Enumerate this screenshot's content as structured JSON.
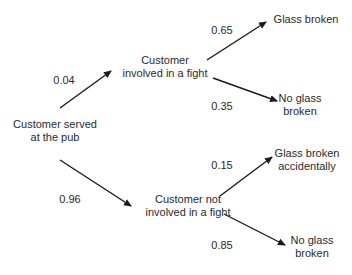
{
  "diagram": {
    "type": "probability-tree",
    "nodes": {
      "root": {
        "lines": [
          "Customer served",
          "at the pub"
        ]
      },
      "fight": {
        "lines": [
          "Customer",
          "involved in a fight"
        ]
      },
      "no_fight": {
        "lines": [
          "Customer not",
          "involved in a fight"
        ]
      },
      "fight_glass_broken": {
        "lines": [
          "Glass broken"
        ]
      },
      "fight_no_glass": {
        "lines": [
          "No glass",
          "broken"
        ]
      },
      "nofight_glass_broken": {
        "lines": [
          "Glass broken",
          "accidentally"
        ]
      },
      "nofight_no_glass": {
        "lines": [
          "No glass",
          "broken"
        ]
      }
    },
    "edges": {
      "root_to_fight": {
        "prob": "0.04"
      },
      "root_to_no_fight": {
        "prob": "0.96"
      },
      "fight_to_glass_broken": {
        "prob": "0.65"
      },
      "fight_to_no_glass": {
        "prob": "0.35"
      },
      "nofight_to_glass_broken": {
        "prob": "0.15"
      },
      "nofight_to_no_glass": {
        "prob": "0.85"
      }
    },
    "colors": {
      "line": "#1a1a1a",
      "text": "#2a2a2a",
      "background": "#ffffff"
    }
  }
}
